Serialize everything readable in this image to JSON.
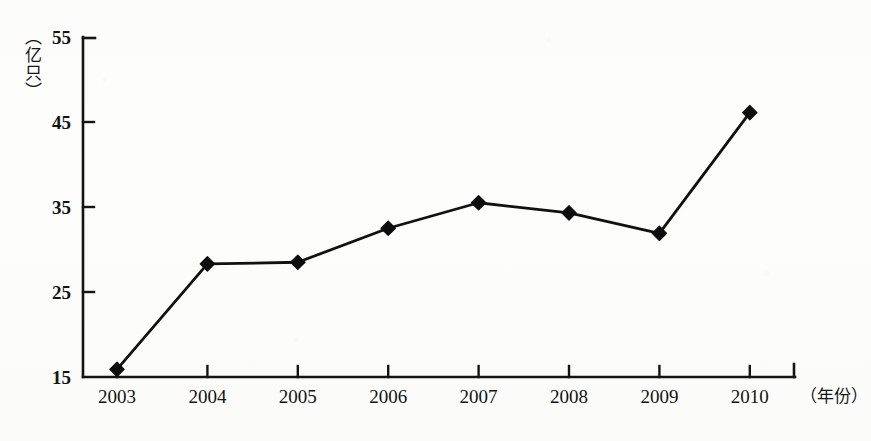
{
  "chart_data": {
    "type": "line",
    "title": "",
    "subtitle": "",
    "xlabel": "（年份）",
    "ylabel": "（亿只）",
    "categories": [
      "2003",
      "2004",
      "2005",
      "2006",
      "2007",
      "2008",
      "2009",
      "2010"
    ],
    "values": [
      15.9,
      28.3,
      28.5,
      32.5,
      35.5,
      34.3,
      31.9,
      46.1
    ],
    "series": [
      {
        "name": "存栏量",
        "values": [
          15.9,
          28.3,
          28.5,
          32.5,
          35.5,
          34.3,
          31.9,
          46.1
        ]
      }
    ],
    "ylim": [
      15,
      55
    ],
    "yticks": [
      15,
      25,
      35,
      45,
      55
    ],
    "ytick_labels": [
      "15",
      "25",
      "35",
      "45",
      "55"
    ],
    "xtick_labels": [
      "2003",
      "2004",
      "2005",
      "2006",
      "2007",
      "2008",
      "2009",
      "2010"
    ],
    "grid": false,
    "legend": false,
    "legend_position": "none",
    "marker": "diamond",
    "line_color": "#111111",
    "marker_color": "#0d0d0d",
    "axis_color": "#141414",
    "background_color": "#fdfdfb",
    "annotations": []
  },
  "axes": {
    "y_unit_label": "（亿只）",
    "x_unit_label": "（年份）"
  }
}
